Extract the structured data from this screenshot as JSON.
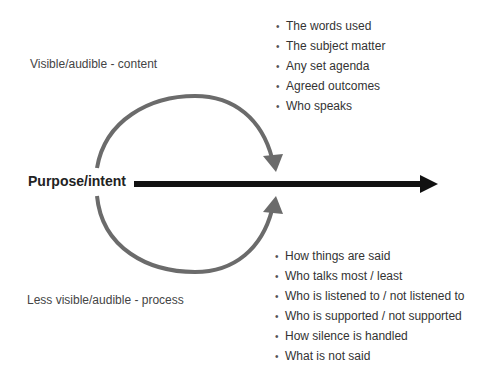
{
  "diagram": {
    "central_label": "Purpose/intent",
    "top_label": "Visible/audible - content",
    "bottom_label": "Less visible/audible - process",
    "content_items": [
      "The words used",
      "The subject matter",
      "Any set agenda",
      "Agreed outcomes",
      "Who speaks"
    ],
    "process_items": [
      "How things are said",
      "Who talks most / least",
      "Who is listened to / not listened to",
      "Who is supported / not supported",
      "How silence is handled",
      "What is not said"
    ],
    "bullet_glyph": "•",
    "colors": {
      "main_arrow": "#111111",
      "arc_arrows": "#6b6b6b",
      "text": "#333333"
    }
  }
}
